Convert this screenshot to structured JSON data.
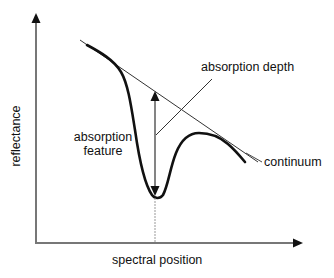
{
  "diagram": {
    "type": "spectral absorption feature schematic",
    "axes": {
      "y_label": "reflectance",
      "x_label": "spectral position"
    },
    "annotations": {
      "absorption_depth": "absorption depth",
      "absorption_feature_line1": "absorption",
      "absorption_feature_line2": "feature",
      "continuum": "continuum"
    },
    "colors": {
      "background": "#ffffff",
      "axis": "#777777",
      "curve": "#111111",
      "continuum_line": "#333333",
      "text": "#111111"
    },
    "geometry": {
      "y_axis": {
        "x": 36,
        "top": 14,
        "bottom": 243
      },
      "x_axis": {
        "y": 243,
        "left": 36,
        "right": 302
      },
      "continuum_line": {
        "x1": 80,
        "y1": 40,
        "x2": 258,
        "y2": 162
      },
      "depth_arrow": {
        "x": 155,
        "top": 92,
        "bottom": 196
      },
      "minimum_point": {
        "x": 156,
        "y": 197
      },
      "depth_leader": {
        "x1": 156,
        "y1": 135,
        "x2": 212,
        "y2": 79
      }
    }
  }
}
